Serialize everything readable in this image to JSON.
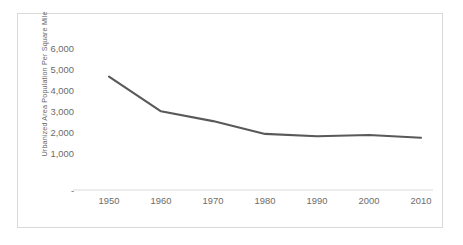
{
  "chart_data": {
    "type": "line",
    "title": "",
    "xlabel": "",
    "ylabel": "Urbanized Area Population Per Square Mile",
    "categories": [
      "1950",
      "1960",
      "1970",
      "1980",
      "1990",
      "2000",
      "2010"
    ],
    "x": [
      1950,
      1960,
      1970,
      1980,
      1990,
      2000,
      2010
    ],
    "values": [
      5400,
      3750,
      3280,
      2670,
      2560,
      2620,
      2490
    ],
    "series": [
      {
        "name": "Urbanized Area Population Per Square Mile",
        "values": [
          5400,
          3750,
          3280,
          2670,
          2560,
          2620,
          2490
        ]
      }
    ],
    "ytick_labels": [
      "6,000",
      "5,000",
      "4,000",
      "3,000",
      "2,000",
      "1,000",
      "-"
    ],
    "ytick_values": [
      6000,
      5000,
      4000,
      3000,
      2000,
      1000,
      0
    ],
    "ylim": [
      0,
      6500
    ],
    "xlim": [
      1945,
      2015
    ],
    "grid": false,
    "legend": "none",
    "line_color": "#595959",
    "axis_color": "#d9d9d9",
    "text_color": "#6b6b6b",
    "border_color": "#d9d9d9",
    "background_color": "#ffffff"
  }
}
